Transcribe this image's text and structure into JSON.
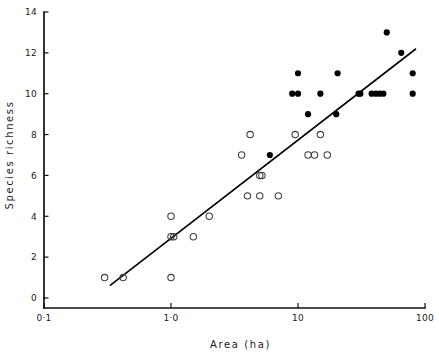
{
  "chart_data": {
    "type": "scatter",
    "title": "",
    "xlabel": "Area  (ha)",
    "ylabel": "Species   richness",
    "xscale": "log",
    "yscale": "linear",
    "xlim": [
      0.1,
      100
    ],
    "ylim": [
      0,
      14
    ],
    "xticks": [
      0.1,
      1.0,
      10,
      100
    ],
    "xtick_labels": [
      "0·1",
      "1·0",
      "10",
      "100"
    ],
    "yticks": [
      0,
      2,
      4,
      6,
      8,
      10,
      12,
      14
    ],
    "ytick_labels": [
      "0",
      "2",
      "4",
      "6",
      "8",
      "10",
      "12",
      "14"
    ],
    "grid": false,
    "legend": false,
    "series": [
      {
        "name": "open-circles",
        "marker": "open circle",
        "color": "#3d3d3d",
        "points": [
          [
            0.3,
            1
          ],
          [
            0.42,
            1
          ],
          [
            1.0,
            1
          ],
          [
            1.0,
            3
          ],
          [
            1.05,
            3
          ],
          [
            1.5,
            3
          ],
          [
            1.0,
            4
          ],
          [
            2.0,
            4
          ],
          [
            4.0,
            5
          ],
          [
            5.0,
            5
          ],
          [
            7.0,
            5
          ],
          [
            5.0,
            6
          ],
          [
            5.2,
            6
          ],
          [
            3.6,
            7
          ],
          [
            12.0,
            7
          ],
          [
            13.5,
            7
          ],
          [
            17.0,
            7
          ],
          [
            4.2,
            8
          ],
          [
            9.5,
            8
          ],
          [
            15.0,
            8
          ]
        ]
      },
      {
        "name": "filled-circles",
        "marker": "filled circle",
        "color": "#000000",
        "points": [
          [
            6.0,
            7
          ],
          [
            12.0,
            9
          ],
          [
            20.0,
            9
          ],
          [
            9.0,
            10
          ],
          [
            10.0,
            10
          ],
          [
            15.0,
            10
          ],
          [
            30.0,
            10
          ],
          [
            31.0,
            10
          ],
          [
            38.0,
            10
          ],
          [
            41.0,
            10
          ],
          [
            44.0,
            10
          ],
          [
            47.0,
            10
          ],
          [
            80.0,
            10
          ],
          [
            10.0,
            11
          ],
          [
            20.5,
            11
          ],
          [
            80.0,
            11
          ],
          [
            65.0,
            12
          ],
          [
            50.0,
            13
          ]
        ]
      }
    ],
    "fit_line": {
      "name": "regression-line",
      "color": "#000000",
      "x_start": 0.33,
      "y_start": 0.6,
      "x_end": 85.0,
      "y_end": 12.2
    }
  }
}
